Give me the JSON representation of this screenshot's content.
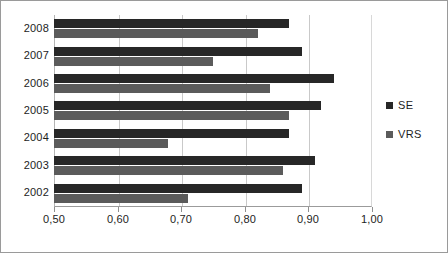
{
  "chart_data": {
    "type": "bar",
    "orientation": "horizontal",
    "title": "",
    "subtitle": "",
    "xlabel": "",
    "ylabel": "",
    "categories": [
      "2008",
      "2007",
      "2006",
      "2005",
      "2004",
      "2003",
      "2002"
    ],
    "series": [
      {
        "name": "SE",
        "color": "#272727",
        "values": [
          0.87,
          0.89,
          0.94,
          0.92,
          0.87,
          0.91,
          0.89
        ]
      },
      {
        "name": "VRS",
        "color": "#5b5b5b",
        "values": [
          0.82,
          0.75,
          0.84,
          0.87,
          0.68,
          0.86,
          0.71
        ]
      }
    ],
    "xlim": [
      0.5,
      1.0
    ],
    "xticks": [
      0.5,
      0.6,
      0.7,
      0.8,
      0.9,
      1.0
    ],
    "xticklabels": [
      "0,50",
      "0,60",
      "0,70",
      "0,80",
      "0,90",
      "1,00"
    ],
    "grid": true,
    "grid_axis": "x",
    "legend": {
      "position": "right",
      "entries": [
        {
          "label": "SE",
          "color": "#272727"
        },
        {
          "label": "VRS",
          "color": "#5b5b5b"
        }
      ]
    },
    "background": "#ffffff",
    "border_color": "#9a9a9a"
  }
}
